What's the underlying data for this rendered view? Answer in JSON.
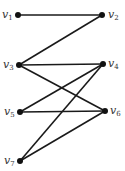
{
  "graph": {
    "type": "bipartite-graph",
    "nodes": [
      {
        "id": "v1",
        "name": "v",
        "sub": "1",
        "x": 18,
        "y": 15,
        "label_side": "left"
      },
      {
        "id": "v2",
        "name": "v",
        "sub": "2",
        "x": 102,
        "y": 15,
        "label_side": "right"
      },
      {
        "id": "v3",
        "name": "v",
        "sub": "3",
        "x": 19,
        "y": 65,
        "label_side": "left"
      },
      {
        "id": "v4",
        "name": "v",
        "sub": "4",
        "x": 103,
        "y": 64,
        "label_side": "right"
      },
      {
        "id": "v5",
        "name": "v",
        "sub": "5",
        "x": 20,
        "y": 112,
        "label_side": "left"
      },
      {
        "id": "v6",
        "name": "v",
        "sub": "6",
        "x": 105,
        "y": 111,
        "label_side": "right"
      },
      {
        "id": "v7",
        "name": "v",
        "sub": "7",
        "x": 20,
        "y": 161,
        "label_side": "left"
      }
    ],
    "edges": [
      [
        "v1",
        "v2"
      ],
      [
        "v2",
        "v3"
      ],
      [
        "v3",
        "v4"
      ],
      [
        "v3",
        "v6"
      ],
      [
        "v4",
        "v5"
      ],
      [
        "v4",
        "v7"
      ],
      [
        "v5",
        "v6"
      ],
      [
        "v6",
        "v7"
      ]
    ]
  },
  "labels": {
    "v1": {
      "name": "v",
      "sub": "1"
    },
    "v2": {
      "name": "v",
      "sub": "2"
    },
    "v3": {
      "name": "v",
      "sub": "3"
    },
    "v4": {
      "name": "v",
      "sub": "4"
    },
    "v5": {
      "name": "v",
      "sub": "5"
    },
    "v6": {
      "name": "v",
      "sub": "6"
    },
    "v7": {
      "name": "v",
      "sub": "7"
    }
  }
}
